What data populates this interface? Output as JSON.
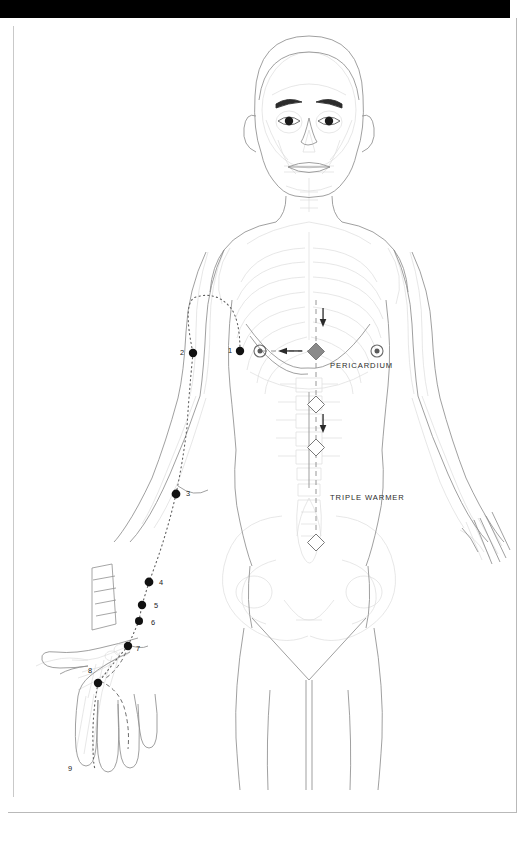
{
  "page": {
    "banner_color": "#000000",
    "background_color": "#ffffff",
    "frame_color": "#b9b9b9"
  },
  "figure": {
    "view": "anterior",
    "line_color": "#8c8c8c",
    "skeleton_color": "#d8d8d8",
    "point_color": "#111111",
    "meridian_color": "#6b6b6b"
  },
  "organ_labels": [
    {
      "id": "pericardium",
      "text": "PERICARDIUM",
      "x": 330,
      "y": 366
    },
    {
      "id": "triple-warmer",
      "text": "TRIPLE WARMER",
      "x": 330,
      "y": 498
    }
  ],
  "organ_markers": [
    {
      "id": "pericardium-diamond",
      "shape": "diamond-filled",
      "color": "#7f7f7f",
      "x": 316,
      "y": 351
    },
    {
      "id": "triple-warmer-upper-diamond",
      "shape": "diamond-hollow",
      "color": "#7f7f7f",
      "x": 316,
      "y": 404
    },
    {
      "id": "triple-warmer-middle-diamond",
      "shape": "diamond-hollow",
      "color": "#7f7f7f",
      "x": 316,
      "y": 447
    },
    {
      "id": "triple-warmer-lower-diamond",
      "shape": "diamond-hollow",
      "color": "#7f7f7f",
      "x": 316,
      "y": 542
    }
  ],
  "nipple_markers": [
    {
      "id": "nipple-left",
      "shape": "concentric-circle",
      "x": 260,
      "y": 351
    },
    {
      "id": "nipple-right",
      "shape": "concentric-circle",
      "x": 377,
      "y": 351
    }
  ],
  "flow_arrows": [
    {
      "id": "arrow-to-point-1",
      "direction": "left",
      "x": 286,
      "y": 351
    },
    {
      "id": "arrow-down-upper",
      "direction": "down",
      "x": 323,
      "y": 318
    },
    {
      "id": "arrow-down-lower",
      "direction": "down",
      "x": 323,
      "y": 424
    }
  ],
  "acupoints": [
    {
      "num": "1",
      "x": 240,
      "y": 351,
      "label_x": 232,
      "label_y": 351,
      "label_side": "left"
    },
    {
      "num": "2",
      "x": 193,
      "y": 353,
      "label_x": 184,
      "label_y": 353,
      "label_side": "left"
    },
    {
      "num": "3",
      "x": 176,
      "y": 494,
      "label_x": 187,
      "label_y": 494,
      "label_side": "right"
    },
    {
      "num": "4",
      "x": 149,
      "y": 582,
      "label_x": 160,
      "label_y": 584,
      "label_side": "right"
    },
    {
      "num": "5",
      "x": 142,
      "y": 605,
      "label_x": 155,
      "label_y": 607,
      "label_side": "right"
    },
    {
      "num": "6",
      "x": 139,
      "y": 621,
      "label_x": 152,
      "label_y": 624,
      "label_side": "right"
    },
    {
      "num": "7",
      "x": 128,
      "y": 646,
      "label_x": 137,
      "label_y": 650,
      "label_side": "right"
    },
    {
      "num": "8",
      "x": 98,
      "y": 683,
      "label_x": 90,
      "label_y": 673,
      "label_side": "left"
    },
    {
      "num": "9",
      "x": null,
      "y": null,
      "label_x": 70,
      "label_y": 770,
      "label_side": "below"
    }
  ],
  "point_count": 9,
  "ruler": {
    "id": "cun-ruler",
    "segments": 5,
    "x": 88,
    "y": 568,
    "width": 26,
    "height": 62
  }
}
